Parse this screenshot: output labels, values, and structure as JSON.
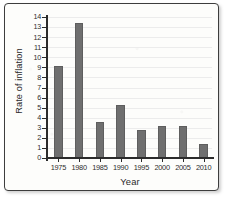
{
  "chart_data": {
    "type": "bar",
    "title": "",
    "xlabel": "Year",
    "ylabel": "Rate of inflation",
    "categories": [
      "1975",
      "1980",
      "1985",
      "1990",
      "1995",
      "2000",
      "2005",
      "2010"
    ],
    "values": [
      9.1,
      13.4,
      3.6,
      5.3,
      2.8,
      3.2,
      3.2,
      1.4
    ],
    "ylim": [
      0,
      14
    ],
    "ytick_labels": [
      "0",
      "1",
      "2",
      "3",
      "4",
      "5",
      "6",
      "7",
      "8",
      "9",
      "10",
      "11",
      "12",
      "13",
      "14"
    ],
    "ytick_values": [
      0,
      1,
      2,
      3,
      4,
      5,
      6,
      7,
      8,
      9,
      10,
      11,
      12,
      13,
      14
    ],
    "grid": true,
    "legend": false,
    "bar_color": "#6f6f6f",
    "axis_color": "#2b2b2b",
    "gridline_color": "#ececec",
    "background_color": "#fdfdfb"
  }
}
